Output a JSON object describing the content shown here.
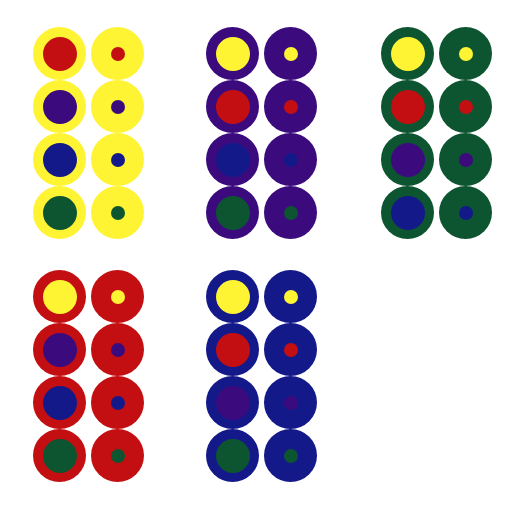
{
  "colors": {
    "yellow": "#fff433",
    "purple": "#3b0b7e",
    "green": "#0c5530",
    "red": "#c40f12",
    "blue": "#14198a"
  },
  "groups": [
    {
      "name": "yellow-surround",
      "surround": "yellow",
      "x": 33,
      "y": 27,
      "inners": [
        "red",
        "purple",
        "blue",
        "green"
      ]
    },
    {
      "name": "purple-surround",
      "surround": "purple",
      "x": 206,
      "y": 27,
      "inners": [
        "yellow",
        "red",
        "blue",
        "green"
      ]
    },
    {
      "name": "green-surround",
      "surround": "green",
      "x": 381,
      "y": 27,
      "inners": [
        "yellow",
        "red",
        "purple",
        "blue"
      ]
    },
    {
      "name": "red-surround",
      "surround": "red",
      "x": 33,
      "y": 270,
      "inners": [
        "yellow",
        "purple",
        "blue",
        "green"
      ]
    },
    {
      "name": "blue-surround",
      "surround": "blue",
      "x": 206,
      "y": 270,
      "inners": [
        "yellow",
        "red",
        "purple",
        "green"
      ]
    }
  ],
  "layout": {
    "disc_diameter": 53,
    "row_pitch": 53,
    "col_offset": 58,
    "inner_large_diameter": 34,
    "inner_small_diameter": 14
  }
}
